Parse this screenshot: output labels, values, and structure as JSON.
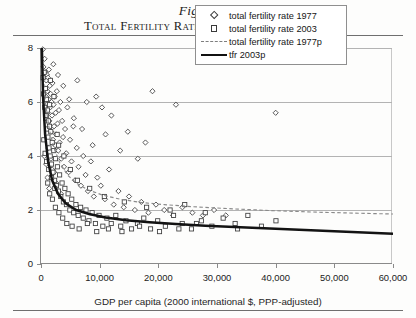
{
  "figure": {
    "number": "Figure 8.1",
    "title": "Total Fertility Rate vs. Wealth, 1977–2003"
  },
  "legend": {
    "items": [
      {
        "label": "total fertility rate 1977",
        "symbol": "diamond-marker"
      },
      {
        "label": "total fertility rate 2003",
        "symbol": "square-marker"
      },
      {
        "label": "total fertility rate 1977p",
        "symbol": "dashed-line"
      },
      {
        "label": "tfr 2003p",
        "symbol": "solid-line"
      }
    ]
  },
  "chart_data": {
    "type": "scatter",
    "title": "Total Fertility Rate vs. Wealth, 1977–2003",
    "xlabel": "GDP per capita (2000 international $, PPP-adjusted)",
    "ylabel": "children per woman of childbearing age",
    "xlim": [
      0,
      60000
    ],
    "ylim": [
      0,
      8
    ],
    "xticks": [
      0,
      10000,
      20000,
      30000,
      40000,
      50000,
      60000
    ],
    "xticklabels": [
      "0",
      "10,000",
      "20,000",
      "30,000",
      "40,000",
      "50,000",
      "60,000"
    ],
    "yticks": [
      0,
      2,
      4,
      6,
      8
    ],
    "yticklabels": [
      "0",
      "2",
      "4",
      "6",
      "8"
    ],
    "grid": "horizontal",
    "legend_position": "upper right",
    "series": [
      {
        "name": "total fertility rate 1977",
        "marker": "diamond",
        "points": [
          [
            320,
            7.95
          ],
          [
            420,
            7.3
          ],
          [
            520,
            6.9
          ],
          [
            610,
            7.6
          ],
          [
            700,
            6.5
          ],
          [
            760,
            7.1
          ],
          [
            830,
            6.2
          ],
          [
            900,
            6.8
          ],
          [
            960,
            5.9
          ],
          [
            1020,
            7.0
          ],
          [
            1080,
            6.4
          ],
          [
            1150,
            5.6
          ],
          [
            1210,
            6.9
          ],
          [
            1280,
            6.1
          ],
          [
            1340,
            7.2
          ],
          [
            1420,
            5.3
          ],
          [
            1500,
            6.6
          ],
          [
            1570,
            5.8
          ],
          [
            1650,
            6.3
          ],
          [
            1720,
            4.9
          ],
          [
            1800,
            6.0
          ],
          [
            1880,
            5.5
          ],
          [
            1960,
            6.7
          ],
          [
            2050,
            4.6
          ],
          [
            2140,
            5.9
          ],
          [
            2230,
            5.1
          ],
          [
            2320,
            6.2
          ],
          [
            2410,
            4.4
          ],
          [
            2500,
            5.6
          ],
          [
            2600,
            4.8
          ],
          [
            2700,
            6.4
          ],
          [
            2820,
            5.2
          ],
          [
            2940,
            4.2
          ],
          [
            3060,
            5.7
          ],
          [
            3180,
            4.5
          ],
          [
            3300,
            6.0
          ],
          [
            3450,
            3.9
          ],
          [
            3600,
            5.3
          ],
          [
            3760,
            4.7
          ],
          [
            3920,
            3.6
          ],
          [
            4100,
            5.0
          ],
          [
            4300,
            4.1
          ],
          [
            4500,
            5.8
          ],
          [
            4700,
            3.4
          ],
          [
            4950,
            4.6
          ],
          [
            5200,
            3.8
          ],
          [
            5500,
            5.1
          ],
          [
            5800,
            3.1
          ],
          [
            6100,
            4.3
          ],
          [
            6400,
            3.6
          ],
          [
            6800,
            2.9
          ],
          [
            7200,
            4.0
          ],
          [
            7600,
            3.3
          ],
          [
            8000,
            2.7
          ],
          [
            8500,
            3.8
          ],
          [
            9000,
            2.5
          ],
          [
            9600,
            3.2
          ],
          [
            10200,
            2.9
          ],
          [
            10900,
            2.4
          ],
          [
            11600,
            3.5
          ],
          [
            12400,
            2.2
          ],
          [
            13200,
            2.7
          ],
          [
            14100,
            2.1
          ],
          [
            15000,
            2.5
          ],
          [
            16000,
            2.0
          ],
          [
            17100,
            2.3
          ],
          [
            18300,
            1.9
          ],
          [
            19600,
            2.2
          ],
          [
            21000,
            2.0
          ],
          [
            22500,
            1.8
          ],
          [
            24100,
            2.1
          ],
          [
            25800,
            1.9
          ],
          [
            27600,
            1.8
          ],
          [
            29500,
            2.0
          ],
          [
            31500,
            1.8
          ],
          [
            2100,
            7.4
          ],
          [
            2900,
            7.0
          ],
          [
            3800,
            6.6
          ],
          [
            4800,
            6.1
          ],
          [
            5600,
            5.4
          ],
          [
            7000,
            5.0
          ],
          [
            8800,
            4.4
          ],
          [
            11000,
            4.8
          ],
          [
            13500,
            4.2
          ],
          [
            16500,
            3.9
          ],
          [
            19000,
            6.4
          ],
          [
            23000,
            5.9
          ],
          [
            40000,
            5.6
          ],
          [
            6200,
            6.8
          ],
          [
            9400,
            6.2
          ],
          [
            1100,
            3.2
          ],
          [
            1400,
            2.8
          ],
          [
            1900,
            3.5
          ],
          [
            2600,
            3.0
          ],
          [
            3400,
            2.6
          ],
          [
            560,
            4.0
          ],
          [
            880,
            3.7
          ],
          [
            1250,
            4.3
          ],
          [
            1700,
            3.9
          ],
          [
            2250,
            3.4
          ],
          [
            14800,
            4.9
          ],
          [
            17800,
            4.5
          ],
          [
            12000,
            5.5
          ],
          [
            10400,
            5.8
          ],
          [
            7800,
            6.0
          ]
        ]
      },
      {
        "name": "total fertility rate 2003",
        "marker": "square",
        "points": [
          [
            340,
            6.9
          ],
          [
            430,
            6.3
          ],
          [
            540,
            7.1
          ],
          [
            640,
            5.8
          ],
          [
            740,
            6.5
          ],
          [
            820,
            5.4
          ],
          [
            910,
            6.1
          ],
          [
            1000,
            5.0
          ],
          [
            1090,
            5.7
          ],
          [
            1180,
            4.7
          ],
          [
            1270,
            5.3
          ],
          [
            1360,
            4.3
          ],
          [
            1460,
            5.9
          ],
          [
            1560,
            4.0
          ],
          [
            1670,
            4.9
          ],
          [
            1790,
            3.7
          ],
          [
            1910,
            4.5
          ],
          [
            2040,
            3.4
          ],
          [
            2180,
            4.2
          ],
          [
            2320,
            3.1
          ],
          [
            2470,
            3.9
          ],
          [
            2630,
            2.9
          ],
          [
            2800,
            3.6
          ],
          [
            2980,
            2.7
          ],
          [
            3170,
            3.3
          ],
          [
            3370,
            2.5
          ],
          [
            3590,
            3.0
          ],
          [
            3820,
            2.3
          ],
          [
            4070,
            2.8
          ],
          [
            4340,
            2.2
          ],
          [
            4620,
            2.6
          ],
          [
            4920,
            2.0
          ],
          [
            5240,
            2.4
          ],
          [
            5580,
            1.9
          ],
          [
            5950,
            2.2
          ],
          [
            6340,
            1.8
          ],
          [
            6750,
            2.1
          ],
          [
            7200,
            1.7
          ],
          [
            7670,
            2.0
          ],
          [
            8170,
            1.6
          ],
          [
            8710,
            1.9
          ],
          [
            9280,
            1.5
          ],
          [
            9890,
            1.8
          ],
          [
            10540,
            1.4
          ],
          [
            11230,
            1.7
          ],
          [
            11970,
            1.5
          ],
          [
            12750,
            1.8
          ],
          [
            13590,
            1.4
          ],
          [
            14480,
            1.6
          ],
          [
            15430,
            1.3
          ],
          [
            16440,
            1.5
          ],
          [
            17520,
            1.7
          ],
          [
            18670,
            1.3
          ],
          [
            19890,
            1.6
          ],
          [
            21200,
            1.4
          ],
          [
            22590,
            1.8
          ],
          [
            24070,
            1.5
          ],
          [
            25650,
            1.3
          ],
          [
            27340,
            1.6
          ],
          [
            29130,
            1.4
          ],
          [
            31050,
            1.7
          ],
          [
            33090,
            1.5
          ],
          [
            35260,
            1.8
          ],
          [
            37580,
            1.4
          ],
          [
            40050,
            1.6
          ],
          [
            1150,
            3.0
          ],
          [
            1480,
            2.6
          ],
          [
            1950,
            2.4
          ],
          [
            2450,
            2.1
          ],
          [
            3050,
            1.9
          ],
          [
            3700,
            1.7
          ],
          [
            4400,
            1.5
          ],
          [
            5300,
            1.4
          ],
          [
            6500,
            1.3
          ],
          [
            7900,
            1.5
          ],
          [
            9500,
            1.2
          ],
          [
            11500,
            1.3
          ],
          [
            13800,
            1.2
          ],
          [
            16800,
            1.4
          ],
          [
            20200,
            1.2
          ],
          [
            23500,
            1.3
          ],
          [
            26500,
            1.5
          ],
          [
            480,
            4.6
          ],
          [
            700,
            4.1
          ],
          [
            960,
            3.8
          ],
          [
            1320,
            3.5
          ],
          [
            1800,
            3.2
          ],
          [
            2350,
            2.8
          ],
          [
            3000,
            4.4
          ],
          [
            3900,
            4.0
          ],
          [
            5000,
            3.5
          ],
          [
            6200,
            3.1
          ],
          [
            8300,
            2.8
          ],
          [
            10800,
            2.5
          ],
          [
            14200,
            2.3
          ],
          [
            18000,
            2.1
          ],
          [
            22000,
            2.0
          ],
          [
            28000,
            1.9
          ],
          [
            33500,
            1.3
          ],
          [
            24500,
            2.2
          ],
          [
            1600,
            6.8
          ],
          [
            2200,
            6.2
          ],
          [
            880,
            5.5
          ],
          [
            1450,
            5.1
          ],
          [
            2750,
            4.8
          ]
        ]
      }
    ],
    "trendlines": [
      {
        "name": "total fertility rate 1977p",
        "style": "dashed",
        "points": [
          [
            150,
            8.0
          ],
          [
            400,
            6.9
          ],
          [
            800,
            5.9
          ],
          [
            1400,
            5.0
          ],
          [
            2200,
            4.3
          ],
          [
            3200,
            3.75
          ],
          [
            4500,
            3.3
          ],
          [
            6000,
            3.0
          ],
          [
            8000,
            2.75
          ],
          [
            10500,
            2.55
          ],
          [
            13500,
            2.4
          ],
          [
            17000,
            2.28
          ],
          [
            21000,
            2.2
          ],
          [
            26000,
            2.12
          ],
          [
            32000,
            2.05
          ],
          [
            39000,
            1.98
          ],
          [
            47000,
            1.92
          ],
          [
            60000,
            1.85
          ]
        ]
      },
      {
        "name": "tfr 2003p",
        "style": "solid",
        "points": [
          [
            150,
            8.0
          ],
          [
            350,
            6.2
          ],
          [
            700,
            4.8
          ],
          [
            1200,
            3.8
          ],
          [
            1900,
            3.1
          ],
          [
            2900,
            2.6
          ],
          [
            4200,
            2.25
          ],
          [
            6000,
            2.0
          ],
          [
            8200,
            1.85
          ],
          [
            11000,
            1.72
          ],
          [
            14500,
            1.62
          ],
          [
            18500,
            1.55
          ],
          [
            23000,
            1.48
          ],
          [
            28000,
            1.42
          ],
          [
            34000,
            1.36
          ],
          [
            41000,
            1.3
          ],
          [
            49000,
            1.22
          ],
          [
            60000,
            1.12
          ]
        ]
      }
    ]
  }
}
